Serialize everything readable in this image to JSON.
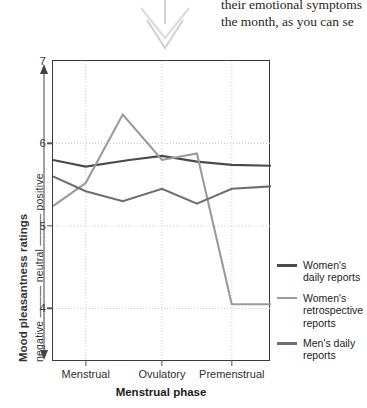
{
  "body_text": {
    "line1": "their emotional symptoms",
    "line2": "the month, as you can se"
  },
  "pointer": {
    "icon": "double-chevron-down-icon"
  },
  "chart_data": {
    "type": "line",
    "title": "",
    "xlabel": "Menstrual phase",
    "ylabel": "Mood pleasantness ratings",
    "ylabel_scale": "negative ——— neutral ——— positive",
    "categories": [
      "Menstrual",
      "Ovulatory",
      "Premenstrual"
    ],
    "x_positions": [
      0.15,
      0.5,
      0.82
    ],
    "ylim": [
      3.35,
      7.0
    ],
    "yticks": [
      7,
      6,
      5,
      4
    ],
    "grid": true,
    "grid_style": "dotted",
    "legend_position": "right",
    "series": [
      {
        "name": "Women's daily reports",
        "color": "#4a4a4a",
        "x": [
          0.0,
          0.15,
          0.35,
          0.5,
          0.66,
          0.82,
          1.0
        ],
        "values": [
          5.8,
          5.72,
          5.8,
          5.85,
          5.78,
          5.74,
          5.73
        ]
      },
      {
        "name": "Women's retrospective reports",
        "color": "#9a9a9a",
        "x": [
          0.0,
          0.15,
          0.32,
          0.5,
          0.66,
          0.82,
          1.0
        ],
        "values": [
          5.24,
          5.52,
          6.35,
          5.8,
          5.88,
          4.05,
          4.05
        ]
      },
      {
        "name": "Men's daily reports",
        "color": "#6e6e6e",
        "x": [
          0.0,
          0.15,
          0.32,
          0.5,
          0.66,
          0.82,
          1.0
        ],
        "values": [
          5.6,
          5.42,
          5.3,
          5.45,
          5.27,
          5.45,
          5.48
        ]
      }
    ]
  },
  "legend": {
    "items": [
      {
        "label": "Women's daily reports",
        "color": "#4a4a4a"
      },
      {
        "label": "Women's retrospective reports",
        "color": "#9a9a9a"
      },
      {
        "label": "Men's daily reports",
        "color": "#6e6e6e"
      }
    ]
  }
}
